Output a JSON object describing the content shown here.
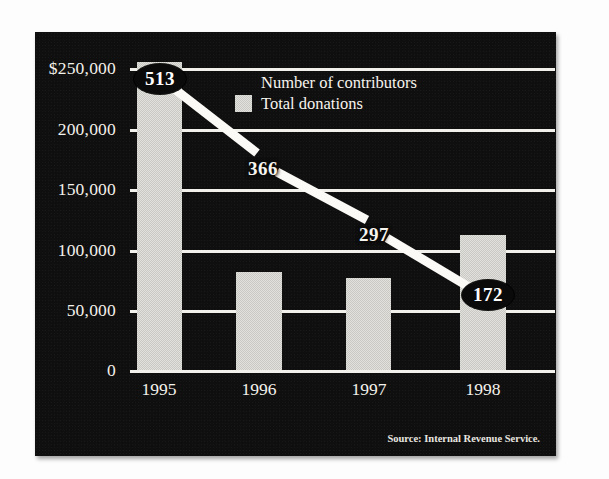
{
  "chart_data": {
    "type": "bar",
    "title": "",
    "subtitle": "",
    "xlabel": "",
    "ylabel": "",
    "categories": [
      "1995",
      "1996",
      "1997",
      "1998"
    ],
    "ylim": [
      0,
      250000
    ],
    "y_ticks": [
      "$250,000",
      "200,000",
      "150,000",
      "100,000",
      "50,000",
      "0"
    ],
    "y_tick_values": [
      250000,
      200000,
      150000,
      100000,
      50000,
      0
    ],
    "grid": true,
    "legend_position": "top-center",
    "series": [
      {
        "name": "Total donations",
        "type": "bar",
        "values": [
          255000,
          81000,
          76000,
          112000
        ],
        "color": "#c9c8c2",
        "axis": "left"
      },
      {
        "name": "Number of contributors",
        "type": "line",
        "values": [
          513,
          366,
          297,
          172
        ],
        "labels": [
          "513",
          "366",
          "297",
          "172"
        ],
        "color": "#ffffff",
        "axis": "right"
      }
    ],
    "annotations": [
      "Source: Internal Revenue Service."
    ],
    "background_color": "#100f0f",
    "text_color": "#f4f2ec"
  },
  "legend": {
    "entries": [
      {
        "label": "Number of contributors",
        "swatch": false
      },
      {
        "label": "Total donations",
        "swatch": true
      }
    ]
  },
  "axis": {
    "y": {
      "t0": "$250,000",
      "t1": "200,000",
      "t2": "150,000",
      "t3": "100,000",
      "t4": "50,000",
      "t5": "0"
    },
    "x": {
      "t0": "1995",
      "t1": "1996",
      "t2": "1997",
      "t3": "1998"
    }
  },
  "points": {
    "p0": "513",
    "p1": "366",
    "p2": "297",
    "p3": "172"
  },
  "source": {
    "text": "Source: Internal Revenue Service."
  }
}
